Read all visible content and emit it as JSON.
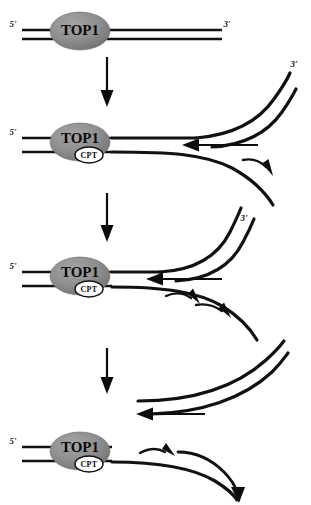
{
  "figure": {
    "background_color": "#ffffff",
    "ink_color": "#111111",
    "enzyme_fill_color": "#8c8c8c",
    "width": 311,
    "height": 505
  },
  "labels": {
    "enzyme": "TOP1",
    "drug": "CPT",
    "five_prime": "5'",
    "three_prime": "3'"
  },
  "panels": [
    {
      "id": "panel-1",
      "order": 1,
      "caption": "TOP1 bound to intact duplex DNA",
      "enzyme_label": "TOP1",
      "drug_label": null,
      "left_end_label": "5'",
      "right_end_label": "3'",
      "has_fork": false
    },
    {
      "id": "panel-2",
      "order": 2,
      "caption": "CPT traps TOP1 cleavage complex; replication fork approaches",
      "enzyme_label": "TOP1",
      "drug_label": "CPT",
      "left_end_label": "5'",
      "right_end_label": "3'",
      "has_fork": true
    },
    {
      "id": "panel-3",
      "order": 3,
      "caption": "Replication fork advances toward trapped TOP1-CPT complex",
      "enzyme_label": "TOP1",
      "drug_label": "CPT",
      "left_end_label": "5'",
      "right_end_label": "3'",
      "has_fork": true
    },
    {
      "id": "panel-4",
      "order": 4,
      "caption": "Fork collision produces a double-strand break; strands released",
      "enzyme_label": "TOP1",
      "drug_label": "CPT",
      "left_end_label": "5'",
      "right_end_label": null,
      "has_fork": true
    }
  ],
  "step_arrows": [
    {
      "id": "step-arrow-1",
      "from_panel": "panel-1",
      "to_panel": "panel-2"
    },
    {
      "id": "step-arrow-2",
      "from_panel": "panel-2",
      "to_panel": "panel-3"
    },
    {
      "id": "step-arrow-3",
      "from_panel": "panel-3",
      "to_panel": "panel-4"
    }
  ]
}
